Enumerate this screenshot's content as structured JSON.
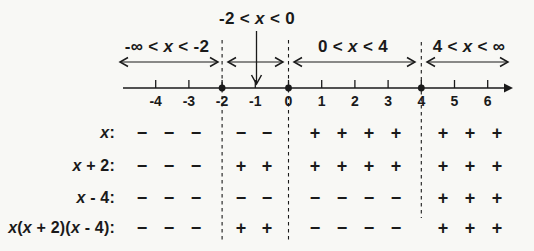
{
  "diagram": {
    "callout_points_to_tick": "-1",
    "intervals": [
      {
        "label": "-∞ < x < -2"
      },
      {
        "label": "-2 < x < 0"
      },
      {
        "label": "0 < x < 4"
      },
      {
        "label": "4 < x < ∞"
      }
    ],
    "axis": {
      "tick_labels": [
        "-4",
        "-3",
        "-2",
        "-1",
        "0",
        "1",
        "2",
        "3",
        "4",
        "5",
        "6"
      ],
      "dot_points": [
        "-2",
        "0",
        "4"
      ],
      "boundary_lines": [
        "-2",
        "0",
        "4"
      ]
    },
    "sign_table": {
      "rows": [
        {
          "label": "x:",
          "signs": [
            [
              "−",
              "−",
              "−"
            ],
            [
              "−",
              "−"
            ],
            [
              "+",
              "+",
              "+",
              "+"
            ],
            [
              "+",
              "+",
              "+"
            ]
          ]
        },
        {
          "label": "x + 2:",
          "signs": [
            [
              "−",
              "−",
              "−"
            ],
            [
              "+",
              "+"
            ],
            [
              "+",
              "+",
              "+",
              "+"
            ],
            [
              "+",
              "+",
              "+"
            ]
          ]
        },
        {
          "label": "x - 4:",
          "signs": [
            [
              "−",
              "−",
              "−"
            ],
            [
              "−",
              "−"
            ],
            [
              "−",
              "−",
              "−",
              "−"
            ],
            [
              "+",
              "+",
              "+"
            ]
          ]
        },
        {
          "label": "x(x + 2)(x - 4):",
          "signs": [
            [
              "−",
              "−",
              "−"
            ],
            [
              "+",
              "+"
            ],
            [
              "−",
              "−",
              "−",
              "−"
            ],
            [
              "+",
              "+",
              "+"
            ]
          ]
        }
      ]
    }
  },
  "colors": {
    "ink": "#1a1a1a",
    "paper": "#f8f8f5"
  }
}
